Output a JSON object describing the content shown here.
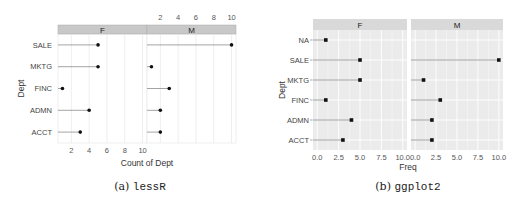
{
  "chart_data": [
    {
      "type": "dot",
      "library": "lessR",
      "caption_prefix": "(a) ",
      "caption_code": "lessR",
      "xlabel": "Count of Dept",
      "ylabel": "Dept",
      "facets": [
        "F",
        "M"
      ],
      "categories": [
        "SALE",
        "MKTG",
        "FINC",
        "ADMN",
        "ACCT"
      ],
      "series": [
        {
          "name": "F",
          "values": [
            5,
            5,
            1,
            4,
            3
          ]
        },
        {
          "name": "M",
          "values": [
            10,
            1,
            3,
            2,
            2
          ]
        }
      ],
      "xticks_bottom": [
        "2",
        "4",
        "6",
        "8",
        "10"
      ],
      "xticks_top": [
        "2",
        "4",
        "6",
        "8",
        "10"
      ],
      "xlim": [
        0.5,
        10.5
      ],
      "grid": true,
      "strip_color": "#c8c8c8",
      "panel_bg": "#ffffff"
    },
    {
      "type": "dot",
      "library": "ggplot2",
      "caption_prefix": "(b) ",
      "caption_code": "ggplot2",
      "xlabel": "Freq",
      "ylabel": "Dept",
      "facets": [
        "F",
        "M"
      ],
      "categories": [
        "NA",
        "SALE",
        "MKTG",
        "FINC",
        "ADMN",
        "ACCT"
      ],
      "series": [
        {
          "name": "F",
          "values": [
            1,
            5,
            5,
            1,
            4,
            3
          ]
        },
        {
          "name": "M",
          "values": [
            null,
            10,
            1,
            3,
            2,
            2
          ]
        }
      ],
      "xticks": [
        "0.0",
        "2.5",
        "5.0",
        "7.5",
        "10.0"
      ],
      "xlim": [
        -0.5,
        10.5
      ],
      "grid": true,
      "strip_color": "#d9d9d9",
      "panel_bg": "#ebebeb"
    }
  ]
}
